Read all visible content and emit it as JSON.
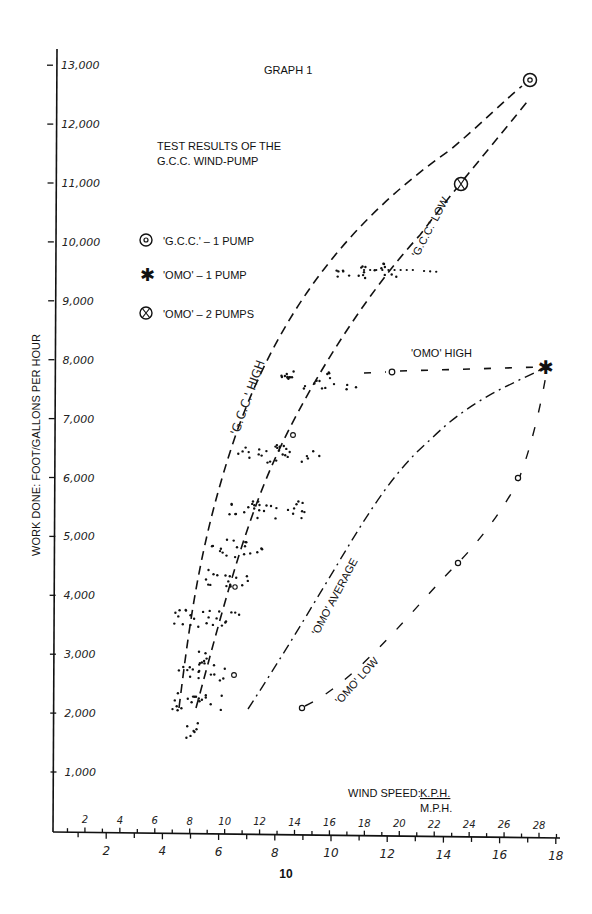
{
  "page": {
    "graph_label": "GRAPH 1",
    "title_line1": "TEST RESULTS OF THE",
    "title_line2": "G.C.C. WIND-PUMP",
    "page_number": "10"
  },
  "legend": {
    "items": [
      {
        "symbol": "circled-dot",
        "label": "'G.C.C.' – 1 PUMP"
      },
      {
        "symbol": "asterisk",
        "label": "'OMO' – 1 PUMP"
      },
      {
        "symbol": "circled-x",
        "label": "'OMO' – 2 PUMPS"
      }
    ]
  },
  "curve_labels": {
    "gcc_high": "'G.C.C.'  HIGH",
    "gcc_low": "'G.C.C.' LOW",
    "omo_high": "'OMO' HIGH",
    "omo_average": "'OMO' AVERAGE",
    "omo_low": "'OMO' LOW"
  },
  "axes": {
    "ylabel": "WORK DONE: FOOT/GALLONS PER HOUR",
    "xlabel_prefix": "WIND SPEED:",
    "xlabel_top_unit": "K.P.H.",
    "xlabel_bottom_unit": "M.P.H.",
    "y_ticks": [
      "1,000",
      "2,000",
      "3,000",
      "4,000",
      "5,000",
      "6,000",
      "7,000",
      "8,000",
      "9,000",
      "10,000",
      "11,000",
      "12,000",
      "13,000"
    ],
    "x_ticks_kph": [
      "2",
      "4",
      "6",
      "8",
      "10",
      "12",
      "14",
      "16",
      "18",
      "20",
      "22",
      "24",
      "26",
      "28"
    ],
    "x_ticks_mph": [
      "2",
      "4",
      "6",
      "8",
      "10",
      "12",
      "14",
      "16",
      "18"
    ]
  },
  "chart_data": {
    "type": "scatter",
    "xlabel": "WIND SPEED: K.P.H. / M.P.H.",
    "ylabel": "WORK DONE: FOOT/GALLONS PER HOUR",
    "xlim_mph": [
      0,
      18.5
    ],
    "ylim": [
      0,
      13500
    ],
    "grid": false,
    "legend_position": "upper-left",
    "series": [
      {
        "name": "'G.C.C.' HIGH",
        "style": "dashed",
        "x_mph": [
          4.6,
          5.2,
          6.0,
          7.5,
          9.5,
          12.0,
          15.0,
          17.1
        ],
        "y": [
          2100,
          3800,
          5400,
          7500,
          9300,
          10900,
          12100,
          12750
        ]
      },
      {
        "name": "'G.C.C.' LOW",
        "style": "dashed",
        "x_mph": [
          5.6,
          7.0,
          8.5,
          10.0,
          12.0,
          14.6,
          17.0
        ],
        "y": [
          2100,
          3800,
          5400,
          7000,
          9500,
          11000,
          12400
        ]
      },
      {
        "name": "'OMO' HIGH",
        "style": "dashed",
        "x_mph": [
          11.0,
          12.2,
          14.0,
          16.0,
          17.65
        ],
        "y": [
          7700,
          7800,
          7830,
          7860,
          7880
        ]
      },
      {
        "name": "'OMO' AVERAGE",
        "style": "dash-dot",
        "x_mph": [
          7.0,
          8.6,
          10.0,
          11.5,
          13.5,
          15.8,
          17.65
        ],
        "y": [
          2100,
          3600,
          4700,
          5600,
          6500,
          7300,
          7880
        ]
      },
      {
        "name": "'OMO' LOW",
        "style": "dashed-sparse",
        "x_mph": [
          9.0,
          11.5,
          14.5,
          16.65,
          17.65
        ],
        "y": [
          2090,
          3100,
          4550,
          6000,
          7880
        ]
      },
      {
        "name": "'G.C.C.' – 1 PUMP",
        "marker": "circled-dot",
        "x_mph": [
          17.1
        ],
        "y": [
          12750
        ]
      },
      {
        "name": "'OMO' – 2 PUMPS",
        "marker": "circled-x",
        "x_mph": [
          14.6
        ],
        "y": [
          11000
        ]
      },
      {
        "name": "'OMO' – 1 PUMP",
        "marker": "asterisk",
        "x_mph": [
          17.65
        ],
        "y": [
          7880
        ]
      },
      {
        "name": "G.C.C. test readings (scatter clusters)",
        "marker": "dot",
        "clusters": [
          {
            "y": 1700,
            "x_mph_range": [
              4.8,
              5.5
            ]
          },
          {
            "y": 2200,
            "x_mph_range": [
              4.2,
              6.2
            ]
          },
          {
            "y": 2700,
            "x_mph_range": [
              4.5,
              6.3
            ]
          },
          {
            "y": 3000,
            "x_mph_range": [
              5.3,
              5.7
            ]
          },
          {
            "y": 3600,
            "x_mph_range": [
              4.4,
              7.0
            ]
          },
          {
            "y": 4300,
            "x_mph_range": [
              5.5,
              7.2
            ]
          },
          {
            "y": 4800,
            "x_mph_range": [
              5.7,
              7.6
            ]
          },
          {
            "y": 5450,
            "x_mph_range": [
              6.2,
              9.3
            ]
          },
          {
            "y": 6400,
            "x_mph_range": [
              6.7,
              9.7
            ]
          },
          {
            "y": 7650,
            "x_mph_range": [
              8.2,
              11.0
            ]
          },
          {
            "y": 9500,
            "x_mph_range": [
              10.2,
              12.4
            ]
          }
        ]
      }
    ]
  }
}
